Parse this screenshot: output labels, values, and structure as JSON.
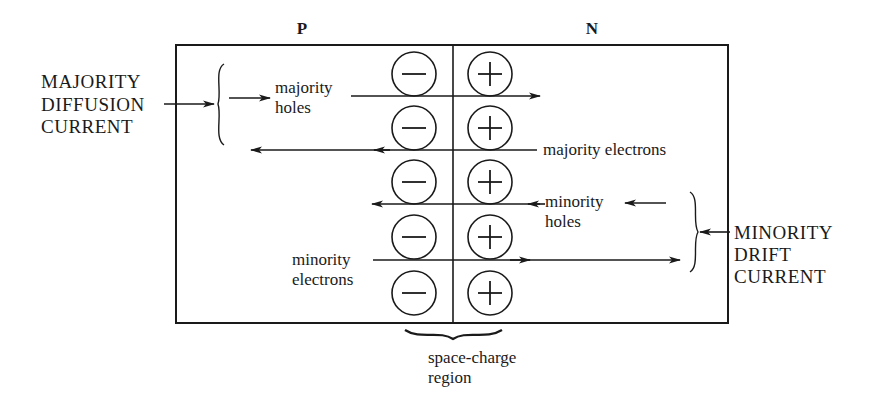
{
  "diagram": {
    "regions": {
      "p_label": "P",
      "n_label": "N"
    },
    "left_annotation": {
      "lines": [
        "MAJORITY",
        "DIFFUSION",
        "CURRENT"
      ]
    },
    "right_annotation": {
      "lines": [
        "MINORITY",
        "DRIFT",
        "CURRENT"
      ]
    },
    "flows": [
      {
        "id": "majority-holes",
        "lines": [
          "majority",
          "holes"
        ],
        "direction": "right"
      },
      {
        "id": "majority-electrons",
        "lines": [
          "majority electrons"
        ],
        "direction": "left"
      },
      {
        "id": "minority-holes",
        "lines": [
          "minority",
          "holes"
        ],
        "direction": "left"
      },
      {
        "id": "minority-electrons",
        "lines": [
          "minority",
          "electrons"
        ],
        "direction": "right"
      }
    ],
    "space_charge": {
      "lines": [
        "space-charge",
        "region"
      ],
      "negative_ions": 5,
      "positive_ions": 5,
      "negative_symbol": "−",
      "positive_symbol": "+"
    },
    "colors": {
      "ink": "#1a1a1a",
      "background": "#ffffff"
    }
  }
}
